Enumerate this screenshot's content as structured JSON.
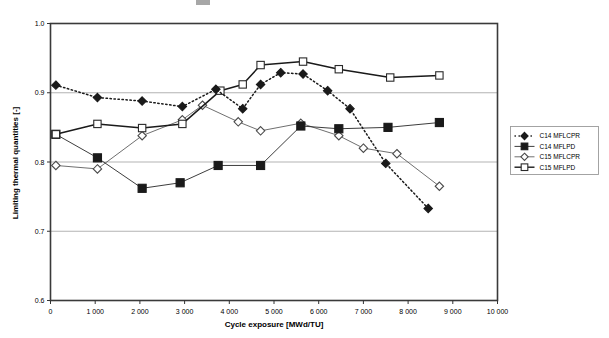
{
  "chart_data": {
    "type": "line",
    "title": "",
    "xlabel": "Cycle exposure [MWd/TU]",
    "ylabel": "Limiting thermal quantities [-]",
    "xlim": [
      0,
      10000
    ],
    "ylim": [
      0.6,
      1.0
    ],
    "ytick_labels": [
      "0.6",
      "0.7",
      "0.8",
      "0.9",
      "1.0"
    ],
    "ytick_values": [
      0.6,
      0.7,
      0.8,
      0.9,
      1.0
    ],
    "xtick_labels": [
      "0",
      "1 000",
      "2 000",
      "3 000",
      "4 000",
      "5 000",
      "6 000",
      "7 000",
      "8 000",
      "9 000",
      "10 000"
    ],
    "xtick_values": [
      0,
      1000,
      2000,
      3000,
      4000,
      5000,
      6000,
      7000,
      8000,
      9000,
      10000
    ],
    "grid": "horizontal",
    "legend_position": "right-outside",
    "series": [
      {
        "name": "C14 MFLCPR",
        "marker": "filled-diamond",
        "line": "dotted",
        "color": "#1a1a1a",
        "x": [
          120,
          1050,
          2050,
          2950,
          3700,
          4300,
          4700,
          5150,
          5650,
          6200,
          6700,
          7500,
          8450
        ],
        "y": [
          0.911,
          0.893,
          0.888,
          0.88,
          0.905,
          0.877,
          0.912,
          0.929,
          0.927,
          0.903,
          0.877,
          0.798,
          0.733
        ]
      },
      {
        "name": "C14 MFLPD",
        "marker": "filled-square",
        "line": "solid-thin",
        "color": "#1a1a1a",
        "x": [
          120,
          1050,
          2050,
          2900,
          3750,
          4700,
          5600,
          6450,
          7550,
          8700
        ],
        "y": [
          0.84,
          0.806,
          0.762,
          0.77,
          0.795,
          0.795,
          0.852,
          0.848,
          0.85,
          0.857
        ]
      },
      {
        "name": "C15 MFLCPR",
        "marker": "open-diamond",
        "line": "solid-thin",
        "color": "#555555",
        "x": [
          120,
          1050,
          2050,
          2950,
          3400,
          4200,
          4700,
          5600,
          6450,
          7000,
          7750,
          8700
        ],
        "y": [
          0.795,
          0.79,
          0.838,
          0.861,
          0.882,
          0.858,
          0.845,
          0.856,
          0.838,
          0.82,
          0.812,
          0.765
        ]
      },
      {
        "name": "C15 MFLPD",
        "marker": "open-square",
        "line": "solid-thick",
        "color": "#1a1a1a",
        "x": [
          120,
          1050,
          2050,
          2950,
          3800,
          4300,
          4700,
          5650,
          6450,
          7600,
          8700
        ],
        "y": [
          0.84,
          0.855,
          0.849,
          0.855,
          0.903,
          0.912,
          0.94,
          0.945,
          0.934,
          0.922,
          0.925
        ]
      }
    ]
  },
  "legend": {
    "items": [
      {
        "label": "C14 MFLCPR"
      },
      {
        "label": "C14 MFLPD"
      },
      {
        "label": "C15 MFLCPR"
      },
      {
        "label": "C15 MFLPD"
      }
    ]
  }
}
